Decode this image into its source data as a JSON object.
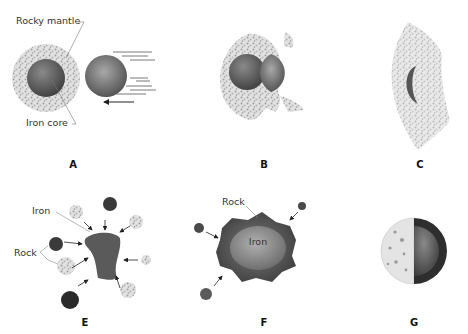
{
  "figure": {
    "type": "Planet / Moon formation by giant impact — stages A–G",
    "panels": [
      {
        "id": "A",
        "label": "A",
        "annotations": [
          "Rocky mantle",
          "Iron core"
        ],
        "description": "Differentiated body (iron core + rocky mantle) approached by an impactor moving left"
      },
      {
        "id": "B",
        "label": "B",
        "annotations": [],
        "description": "Impactor collides with proto-Earth; debris ejected"
      },
      {
        "id": "C",
        "label": "C",
        "annotations": [],
        "description": "Impactor iron flattened, mantle vaporized outward"
      },
      {
        "id": "E",
        "label": "E",
        "annotations": [
          "Iron",
          "Rock"
        ],
        "description": "Iron mass accreting rocky fragments"
      },
      {
        "id": "F",
        "label": "F",
        "annotations": [
          "Rock",
          "Iron"
        ],
        "description": "Iron core surrounded by rock layer, still accreting"
      },
      {
        "id": "G",
        "label": "G",
        "annotations": [],
        "description": "Cutaway of final body"
      }
    ]
  },
  "colors": {
    "background": "#ffffff",
    "iron_dark": "#4a4a4a",
    "iron_mid": "#6e6e6e",
    "rock_speckle": "#b8b8b8",
    "text": "#333333"
  }
}
